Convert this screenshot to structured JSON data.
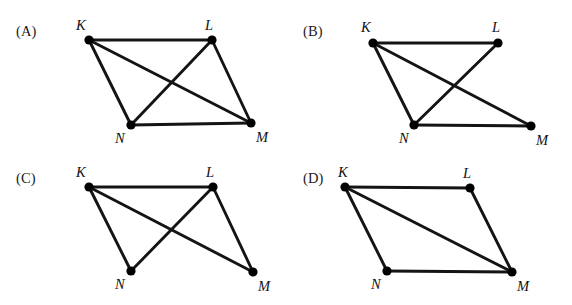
{
  "figure": {
    "type": "graph-diagram-multiple-choice",
    "background_color": "#ffffff",
    "edge_color": "#141414",
    "node_color": "#000000",
    "panel_count": 4,
    "vertex_names": [
      "K",
      "L",
      "M",
      "N"
    ]
  },
  "panels": [
    {
      "id": "A",
      "tag": "(A)",
      "tag_pos": {
        "x": 16,
        "y": 24
      },
      "nodes": [
        {
          "name": "K",
          "x": 89,
          "y": 40,
          "label": "K",
          "label_x": 76,
          "label_y": 18
        },
        {
          "name": "L",
          "x": 212,
          "y": 40,
          "label": "L",
          "label_x": 205,
          "label_y": 18
        },
        {
          "name": "N",
          "x": 131,
          "y": 125,
          "label": "N",
          "label_x": 115,
          "label_y": 131
        },
        {
          "name": "M",
          "x": 251,
          "y": 123,
          "label": "M",
          "label_x": 256,
          "label_y": 130
        }
      ],
      "edges": [
        {
          "from": "K",
          "to": "L"
        },
        {
          "from": "K",
          "to": "N"
        },
        {
          "from": "K",
          "to": "M"
        },
        {
          "from": "L",
          "to": "N"
        },
        {
          "from": "L",
          "to": "M"
        },
        {
          "from": "N",
          "to": "M"
        }
      ],
      "edge_count": 6
    },
    {
      "id": "B",
      "tag": "(B)",
      "tag_pos": {
        "x": 303,
        "y": 24
      },
      "nodes": [
        {
          "name": "K",
          "x": 373,
          "y": 43,
          "label": "K",
          "label_x": 361,
          "label_y": 20
        },
        {
          "name": "L",
          "x": 498,
          "y": 43,
          "label": "L",
          "label_x": 492,
          "label_y": 20
        },
        {
          "name": "N",
          "x": 414,
          "y": 125,
          "label": "N",
          "label_x": 399,
          "label_y": 131
        },
        {
          "name": "M",
          "x": 531,
          "y": 126,
          "label": "M",
          "label_x": 536,
          "label_y": 133
        }
      ],
      "edges": [
        {
          "from": "K",
          "to": "L"
        },
        {
          "from": "K",
          "to": "N"
        },
        {
          "from": "K",
          "to": "M"
        },
        {
          "from": "L",
          "to": "N"
        },
        {
          "from": "N",
          "to": "M"
        }
      ],
      "edge_count": 5
    },
    {
      "id": "C",
      "tag": "(C)",
      "tag_pos": {
        "x": 16,
        "y": 171
      },
      "nodes": [
        {
          "name": "K",
          "x": 89,
          "y": 187,
          "label": "K",
          "label_x": 76,
          "label_y": 165
        },
        {
          "name": "L",
          "x": 213,
          "y": 187,
          "label": "L",
          "label_x": 206,
          "label_y": 165
        },
        {
          "name": "N",
          "x": 131,
          "y": 271,
          "label": "N",
          "label_x": 115,
          "label_y": 277
        },
        {
          "name": "M",
          "x": 253,
          "y": 272,
          "label": "M",
          "label_x": 258,
          "label_y": 279
        }
      ],
      "edges": [
        {
          "from": "K",
          "to": "L"
        },
        {
          "from": "K",
          "to": "N"
        },
        {
          "from": "K",
          "to": "M"
        },
        {
          "from": "L",
          "to": "N"
        },
        {
          "from": "L",
          "to": "M"
        }
      ],
      "edge_count": 5
    },
    {
      "id": "D",
      "tag": "(D)",
      "tag_pos": {
        "x": 303,
        "y": 171
      },
      "nodes": [
        {
          "name": "K",
          "x": 345,
          "y": 187,
          "label": "K",
          "label_x": 338,
          "label_y": 165
        },
        {
          "name": "L",
          "x": 470,
          "y": 188,
          "label": "L",
          "label_x": 463,
          "label_y": 166
        },
        {
          "name": "N",
          "x": 387,
          "y": 271,
          "label": "N",
          "label_x": 371,
          "label_y": 277
        },
        {
          "name": "M",
          "x": 512,
          "y": 272,
          "label": "M",
          "label_x": 517,
          "label_y": 279
        }
      ],
      "edges": [
        {
          "from": "K",
          "to": "L"
        },
        {
          "from": "K",
          "to": "N"
        },
        {
          "from": "K",
          "to": "M"
        },
        {
          "from": "L",
          "to": "M"
        },
        {
          "from": "N",
          "to": "M"
        }
      ],
      "edge_count": 5
    }
  ],
  "style": {
    "node_radius": 4.6,
    "edge_width": 2.9,
    "label_font_size": 14.5,
    "tag_font_size": 14.5
  }
}
